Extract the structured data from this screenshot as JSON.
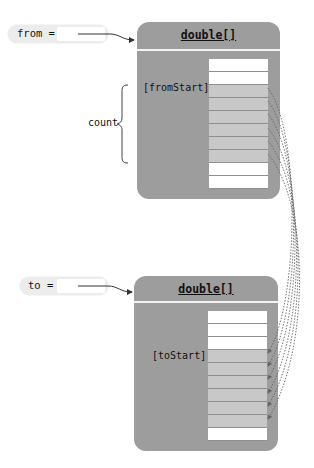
{
  "from_ref": {
    "label": "from ="
  },
  "to_ref": {
    "label": "to ="
  },
  "from_array": {
    "type_label": "double[]",
    "index_label": "[fromStart]",
    "cells": [
      "white",
      "white",
      "gray",
      "gray",
      "gray",
      "gray",
      "gray",
      "gray",
      "white",
      "white"
    ]
  },
  "to_array": {
    "type_label": "double[]",
    "index_label": "[toStart]",
    "cells": [
      "white",
      "white",
      "white",
      "gray",
      "gray",
      "gray",
      "gray",
      "gray",
      "gray",
      "white"
    ]
  },
  "brace": {
    "label": "count"
  },
  "colors": {
    "array_box": "#9d9d9d",
    "copied_cell": "#c8c8c8",
    "empty_cell": "#ffffff",
    "reference_pill": "#ececec",
    "arrow": "#555555"
  }
}
